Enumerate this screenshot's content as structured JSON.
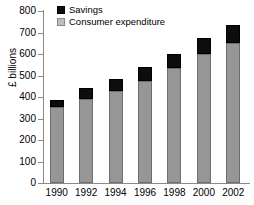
{
  "chart_data": {
    "type": "bar",
    "subtype": "stacked-vertical",
    "title": "",
    "xlabel": "",
    "ylabel": "£ billions",
    "categories": [
      "1990",
      "1992",
      "1994",
      "1996",
      "1998",
      "2000",
      "2002"
    ],
    "series": [
      {
        "name": "Consumer expenditure",
        "color": "#969696",
        "values": [
          353,
          391,
          428,
          474,
          535,
          600,
          651
        ]
      },
      {
        "name": "Savings",
        "color": "#0d0d0d",
        "values": [
          33,
          51,
          56,
          66,
          65,
          74,
          84
        ]
      }
    ],
    "stack_order": [
      "Consumer expenditure",
      "Savings"
    ],
    "totals": [
      386,
      442,
      484,
      540,
      600,
      674,
      735
    ],
    "ylim": [
      0,
      800
    ],
    "ytick_step": 100,
    "yticks": [
      0,
      100,
      200,
      300,
      400,
      500,
      600,
      700,
      800
    ],
    "ytick_labels": [
      "0",
      "100",
      "200",
      "300",
      "400",
      "500",
      "600",
      "700",
      "800"
    ],
    "grid": false,
    "legend_position": "top-left",
    "legend_entries": [
      "Savings",
      "Consumer expenditure"
    ]
  },
  "axes": {
    "y_title": "£ billions",
    "axis_color": "#8a8a8a"
  },
  "legend": {
    "items": [
      {
        "label": "Savings",
        "swatch": "savings-swatch"
      },
      {
        "label": "Consumer expenditure",
        "swatch": "consumer-expenditure-swatch"
      }
    ]
  }
}
